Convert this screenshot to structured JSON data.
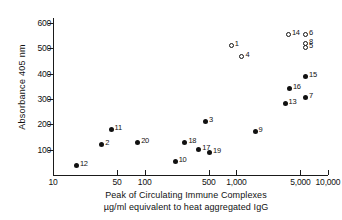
{
  "chart_data": {
    "type": "scatter",
    "title": "",
    "xlabel": "Peak of Circulating Immune Complexes µg/ml equivalent to heat aggregated IgG",
    "xlabel_lines": [
      "Peak of Circulating Immune Complexes",
      "µg/ml equivalent to heat aggregated IgG"
    ],
    "ylabel": "Absorbance 405 nm",
    "xscale": "log",
    "xlim": [
      10,
      10000
    ],
    "ylim": [
      0,
      620
    ],
    "grid": false,
    "legend": "none",
    "xticks": [
      {
        "value": 10,
        "label": "10"
      },
      {
        "value": 50,
        "label": "50"
      },
      {
        "value": 100,
        "label": "100"
      },
      {
        "value": 500,
        "label": "500"
      },
      {
        "value": 1000,
        "label": "1,000"
      },
      {
        "value": 5000,
        "label": "5,000"
      },
      {
        "value": 10000,
        "label": "10,000"
      }
    ],
    "yticks": [
      {
        "value": 100,
        "label": "100"
      },
      {
        "value": 200,
        "label": "200"
      },
      {
        "value": 300,
        "label": "300"
      },
      {
        "value": 400,
        "label": "400"
      },
      {
        "value": 500,
        "label": "500"
      },
      {
        "value": 600,
        "label": "600"
      }
    ],
    "series": [
      {
        "name": "filled",
        "marker": "filled-circle",
        "color": "#111111",
        "points": [
          {
            "label": "12",
            "x": 18,
            "y": 38,
            "label_pos": "right"
          },
          {
            "label": "2",
            "x": 34,
            "y": 122,
            "label_pos": "right"
          },
          {
            "label": "11",
            "x": 43,
            "y": 180,
            "label_pos": "right"
          },
          {
            "label": "20",
            "x": 84,
            "y": 128,
            "label_pos": "right"
          },
          {
            "label": "10",
            "x": 215,
            "y": 55,
            "label_pos": "right"
          },
          {
            "label": "18",
            "x": 275,
            "y": 127,
            "label_pos": "right"
          },
          {
            "label": "17",
            "x": 390,
            "y": 100,
            "label_pos": "right"
          },
          {
            "label": "19",
            "x": 510,
            "y": 87,
            "label_pos": "right"
          },
          {
            "label": "3",
            "x": 460,
            "y": 212,
            "label_pos": "right"
          },
          {
            "label": "9",
            "x": 1600,
            "y": 172,
            "label_pos": "right"
          },
          {
            "label": "13",
            "x": 3400,
            "y": 283,
            "label_pos": "right"
          },
          {
            "label": "16",
            "x": 3800,
            "y": 343,
            "label_pos": "right"
          },
          {
            "label": "15",
            "x": 5700,
            "y": 388,
            "label_pos": "right"
          },
          {
            "label": "7",
            "x": 5700,
            "y": 305,
            "label_pos": "right"
          }
        ]
      },
      {
        "name": "open",
        "marker": "open-circle",
        "color": "#111111",
        "points": [
          {
            "label": "1",
            "x": 880,
            "y": 512,
            "label_pos": "right"
          },
          {
            "label": "4",
            "x": 1150,
            "y": 467,
            "label_pos": "right"
          },
          {
            "label": "14",
            "x": 3700,
            "y": 553,
            "label_pos": "right"
          },
          {
            "label": "6",
            "x": 5700,
            "y": 553,
            "label_pos": "right"
          },
          {
            "label": "8",
            "x": 5700,
            "y": 518,
            "label_pos": "right"
          },
          {
            "label": "5",
            "x": 5700,
            "y": 505,
            "label_pos": "right"
          }
        ]
      }
    ]
  }
}
